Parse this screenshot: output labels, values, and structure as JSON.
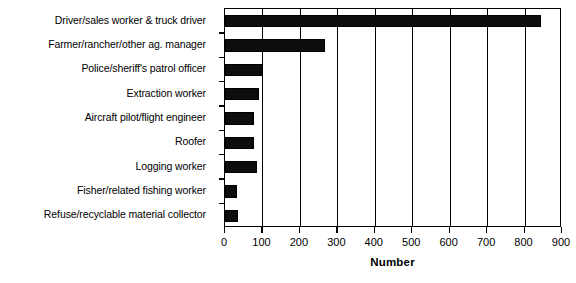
{
  "chart_data": {
    "type": "bar",
    "orientation": "horizontal",
    "title": "",
    "xlabel": "Number",
    "ylabel": "",
    "xlim": [
      0,
      900
    ],
    "xticks": [
      0,
      100,
      200,
      300,
      400,
      500,
      600,
      700,
      800,
      900
    ],
    "xtick_labels": [
      "0",
      "100",
      "200",
      "300",
      "400",
      "500",
      "600",
      "700",
      "800",
      "900"
    ],
    "grid": "vertical",
    "legend": null,
    "bar_color": "#000000",
    "background_color": "#ffffff",
    "categories": [
      "Driver/sales worker & truck driver",
      "Farmer/rancher/other ag. manager",
      "Police/sheriff's patrol officer",
      "Extraction worker",
      "Aircraft pilot/flight engineer",
      "Roofer",
      "Logging worker",
      "Fisher/related fishing worker",
      "Refuse/recyclable material collector"
    ],
    "values": [
      845,
      267,
      101,
      92,
      78,
      78,
      85,
      33,
      35
    ]
  }
}
